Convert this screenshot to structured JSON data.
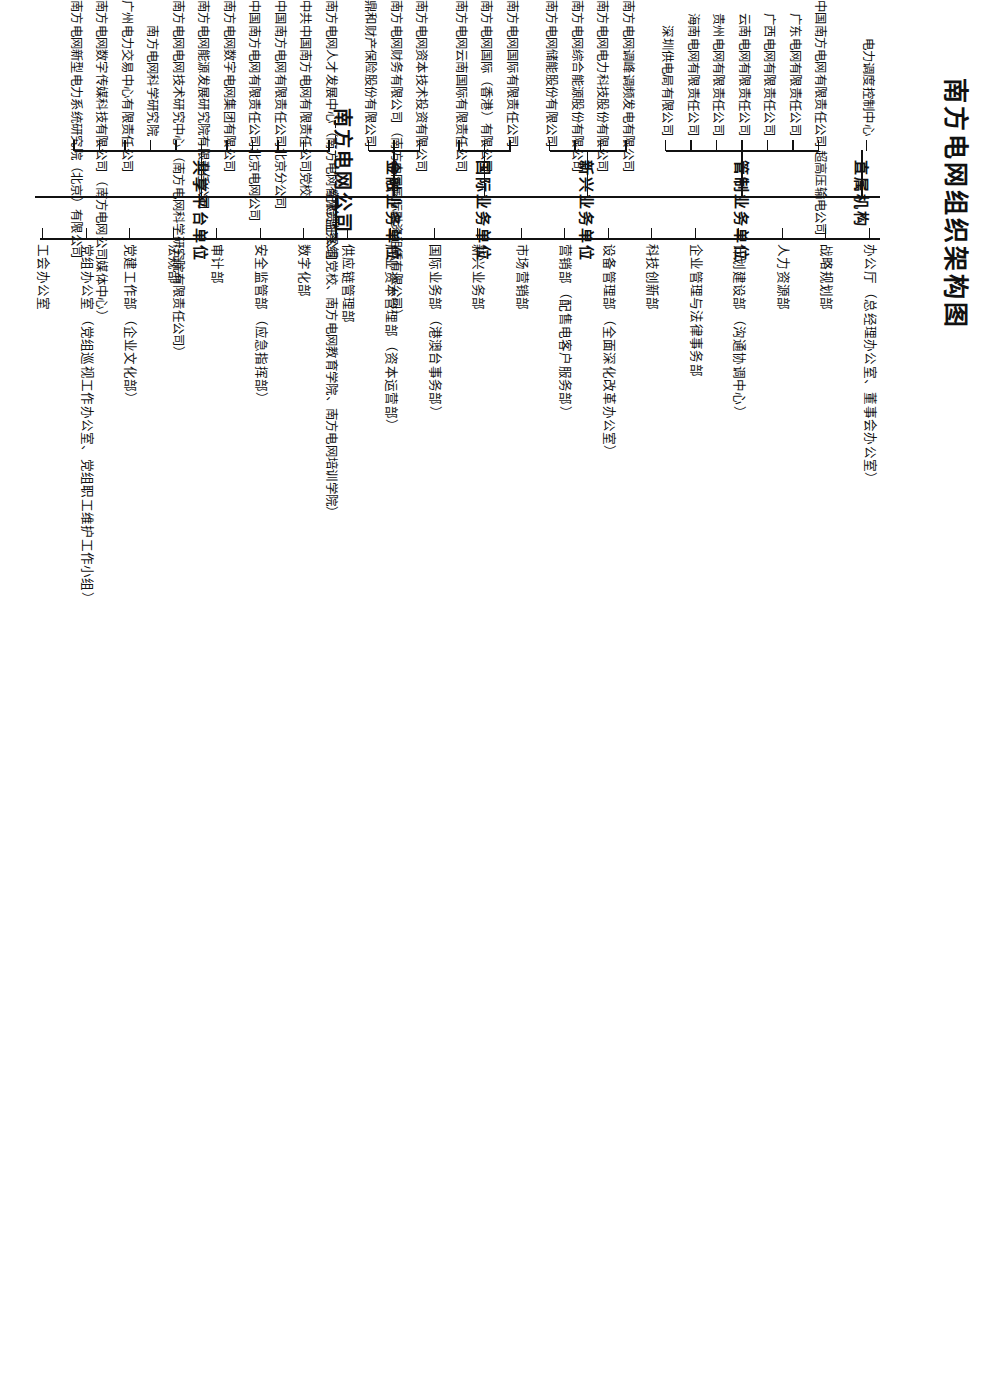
{
  "title": "南方电网组织架构图",
  "root": {
    "label": "南方电网公司",
    "discipline_group": "纪检监察组"
  },
  "departments": [
    {
      "name": "办公厅",
      "sub": "（总经理办公室、董事会办公室）"
    },
    {
      "name": "战略规划部",
      "sub": ""
    },
    {
      "name": "人力资源部",
      "sub": ""
    },
    {
      "name": "计划建设部",
      "sub": "（沟通协调中心）"
    },
    {
      "name": "企业管理与法律事务部",
      "sub": ""
    },
    {
      "name": "科技创新部",
      "sub": ""
    },
    {
      "name": "设备管理部",
      "sub": "（全面深化改革办公室）"
    },
    {
      "name": "营销部",
      "sub": "（配售电客户服务部）"
    },
    {
      "name": "市场营销部",
      "sub": ""
    },
    {
      "name": "新兴业务部",
      "sub": ""
    },
    {
      "name": "国际业务部",
      "sub": "（港澳台事务部）"
    },
    {
      "name": "产业资本管理部",
      "sub": "（资本运营部）"
    },
    {
      "name": "供应链管理部",
      "sub": ""
    },
    {
      "name": "数字化部",
      "sub": ""
    },
    {
      "name": "安全监管部",
      "sub": "（应急指挥部）"
    },
    {
      "name": "审计部",
      "sub": ""
    },
    {
      "name": "法规部",
      "sub": ""
    },
    {
      "name": "党建工作部",
      "sub": "（企业文化部）"
    },
    {
      "name": "党组办公室",
      "sub": "（党组巡视工作办公室、党组职工维护工作小组）"
    },
    {
      "name": "工会办公室",
      "sub": ""
    }
  ],
  "categories": [
    {
      "label": "直属机构",
      "units": [
        {
          "name": "电力调度控制中心",
          "sub": ""
        }
      ]
    },
    {
      "label": "管制业务单位",
      "units": [
        {
          "name": "中国南方电网有限责任公司",
          "sub": "超高压输电公司"
        },
        {
          "name": "广东电网有限责任公司",
          "sub": ""
        },
        {
          "name": "广西电网有限责任公司",
          "sub": ""
        },
        {
          "name": "云南电网有限责任公司",
          "sub": ""
        },
        {
          "name": "贵州电网有限责任公司",
          "sub": ""
        },
        {
          "name": "海南电网有限责任公司",
          "sub": ""
        },
        {
          "name": "深圳供电局有限公司",
          "sub": ""
        }
      ]
    },
    {
      "label": "新兴业务单位",
      "units": [
        {
          "name": "南方电网调峰调频发电有限公司",
          "sub": ""
        },
        {
          "name": "南方电网电力科技股份有限公司",
          "sub": ""
        },
        {
          "name": "南方电网综合能源股份有限公司",
          "sub": ""
        },
        {
          "name": "南方电网储能股份有限公司",
          "sub": ""
        }
      ]
    },
    {
      "label": "国际业务单位",
      "units": [
        {
          "name": "南方电网国际有限责任公司",
          "sub": ""
        },
        {
          "name": "南方电网国际（香港）有限公司",
          "sub": ""
        },
        {
          "name": "南方电网云南国际有限责任公司",
          "sub": ""
        }
      ]
    },
    {
      "label": "金融业务单位",
      "units": [
        {
          "name": "南方电网资本技术投资有限公司",
          "sub": ""
        },
        {
          "name": "南方电网财务有限公司",
          "sub": "（南方电网国际融资租赁有限公司）"
        },
        {
          "name": "鼎和财产保险股份有限公司",
          "sub": ""
        }
      ]
    },
    {
      "label": "共享平台单位",
      "units": [
        {
          "name": "南方电网人才发展中心",
          "sub": "（南方电网有限责任公司党校、南方电网教育学院、南方电网培训学院）"
        },
        {
          "name": "中共中国南方电网有限责任公司党校",
          "sub": ""
        },
        {
          "name": "中国南方电网有限责任公司北京分公司",
          "sub": ""
        },
        {
          "name": "中国南方电网有限责任公司北京电网公司",
          "sub": ""
        },
        {
          "name": "南方电网数字电网集团有限公司",
          "sub": ""
        },
        {
          "name": "南方电网能源发展研究院有限责任公司",
          "sub": ""
        },
        {
          "name": "南方电网电网技术研究中心",
          "sub": "（南方电网科学研究院有限责任公司）"
        },
        {
          "name": "南方电网科学研究院",
          "sub": ""
        },
        {
          "name": "广州电力交易中心有限责任公司",
          "sub": ""
        },
        {
          "name": "南方电网数字传媒科技有限公司",
          "sub": "（南方电网公司媒体中心）"
        },
        {
          "name": "南方电网新型电力系统研究院（北京）有限公司",
          "sub": ""
        }
      ]
    }
  ]
}
